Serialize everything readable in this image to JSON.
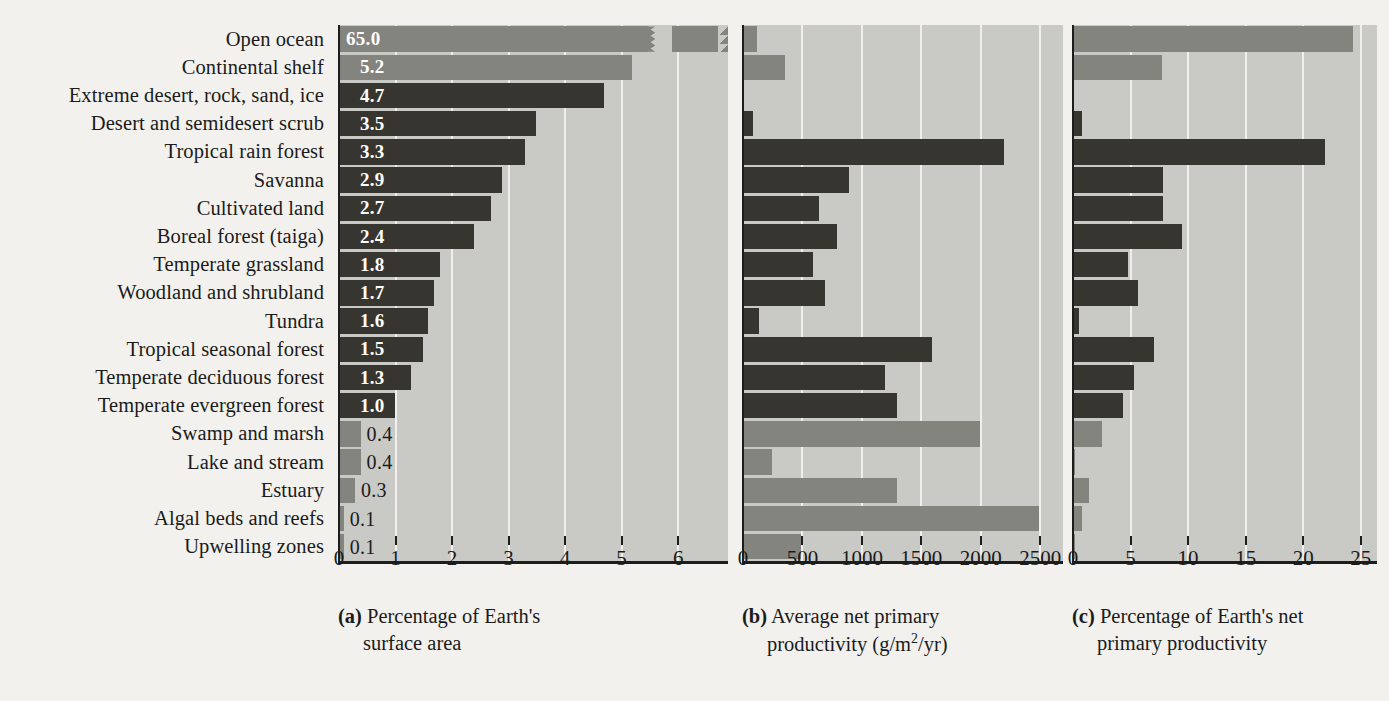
{
  "figure": {
    "background": "#f2f1ed",
    "panel_background": "#c9c9c6",
    "gridline_color": "#f0efec",
    "axis_color": "#1d1d1d",
    "aquatic_bar_color": "#84847f",
    "terrestrial_bar_color": "#37352f"
  },
  "chart_data": {
    "type": "bar",
    "title": "",
    "orientation": "horizontal",
    "grid": true,
    "legend": null,
    "categories": [
      "Open ocean",
      "Continental shelf",
      "Extreme desert, rock, sand, ice",
      "Desert and semidesert scrub",
      "Tropical rain forest",
      "Savanna",
      "Cultivated land",
      "Boreal forest (taiga)",
      "Temperate grassland",
      "Woodland and shrubland",
      "Tundra",
      "Tropical seasonal forest",
      "Temperate deciduous forest",
      "Temperate evergreen forest",
      "Swamp and marsh",
      "Lake and stream",
      "Estuary",
      "Algal beds and reefs",
      "Upwelling zones"
    ],
    "category_types": [
      "aquatic",
      "aquatic",
      "terrestrial",
      "terrestrial",
      "terrestrial",
      "terrestrial",
      "terrestrial",
      "terrestrial",
      "terrestrial",
      "terrestrial",
      "terrestrial",
      "terrestrial",
      "terrestrial",
      "terrestrial",
      "aquatic",
      "aquatic",
      "aquatic",
      "aquatic",
      "aquatic"
    ],
    "panels": [
      {
        "id": "a",
        "letter": "(a)",
        "caption_line1": "Percentage of Earth's",
        "caption_line2": "surface area",
        "xlabel": "Percentage of Earth's surface area",
        "ticks": [
          "0",
          "1",
          "2",
          "3",
          "4",
          "5",
          "6"
        ],
        "tick_values": [
          0,
          1,
          2,
          3,
          4,
          5,
          6
        ],
        "xlim": [
          0,
          6.9
        ],
        "axis_break": true,
        "values": [
          65.0,
          5.2,
          4.7,
          3.5,
          3.3,
          2.9,
          2.7,
          2.4,
          1.8,
          1.7,
          1.6,
          1.5,
          1.3,
          1.0,
          0.4,
          0.4,
          0.3,
          0.1,
          0.1
        ],
        "value_labels": [
          "65.0",
          "5.2",
          "4.7",
          "3.5",
          "3.3",
          "2.9",
          "2.7",
          "2.4",
          "1.8",
          "1.7",
          "1.6",
          "1.5",
          "1.3",
          "1.0",
          "0.4",
          "0.4",
          "0.3",
          "0.1",
          "0.1"
        ]
      },
      {
        "id": "b",
        "letter": "(b)",
        "caption_line1": "Average net primary",
        "caption_line2_pre": "productivity (g/m",
        "caption_line2_sup": "2",
        "caption_line2_post": "/yr)",
        "xlabel": "Average net primary productivity (g/m2/yr)",
        "ticks": [
          "0",
          "500",
          "1000",
          "1500",
          "2000",
          "2500"
        ],
        "tick_values": [
          0,
          500,
          1000,
          1500,
          2000,
          2500
        ],
        "xlim": [
          0,
          2700
        ],
        "axis_break": false,
        "values": [
          125,
          360,
          3,
          90,
          2200,
          900,
          650,
          800,
          600,
          700,
          140,
          1600,
          1200,
          1300,
          2000,
          250,
          1300,
          2500,
          500
        ],
        "value_labels": []
      },
      {
        "id": "c",
        "letter": "(c)",
        "caption_line1": "Percentage of Earth's net",
        "caption_line2": "primary productivity",
        "xlabel": "Percentage of Earth's net primary productivity",
        "ticks": [
          "0",
          "5",
          "10",
          "15",
          "20",
          "25"
        ],
        "tick_values": [
          0,
          5,
          10,
          15,
          20,
          25
        ],
        "xlim": [
          0,
          26.5
        ],
        "axis_break": false,
        "values": [
          24.4,
          7.8,
          0.1,
          0.9,
          22.0,
          7.9,
          7.9,
          9.6,
          4.9,
          5.7,
          0.6,
          7.1,
          5.4,
          4.4,
          2.6,
          0.3,
          1.5,
          0.9,
          0.3
        ],
        "value_labels": []
      }
    ]
  }
}
